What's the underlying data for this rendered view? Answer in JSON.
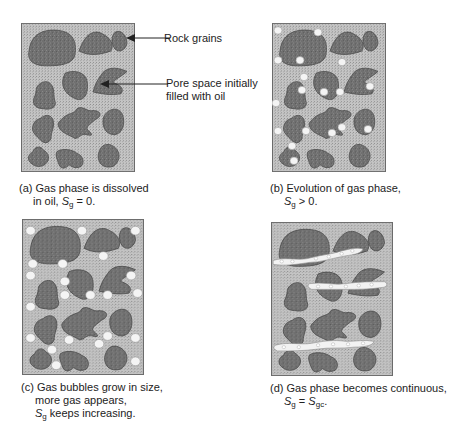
{
  "figure": {
    "colors": {
      "pore_oil": "#b9b9b9",
      "rock_grain": "#6f6f6f",
      "grain_outline": "#4a4a4a",
      "gas_bubble": "#f4f4f4",
      "frame": "#6b6b6b"
    },
    "labels": {
      "rock_grains": "Rock grains",
      "pore_space_line1": "Pore space initially",
      "pore_space_line2": "filled with oil"
    },
    "panels": [
      {
        "id": "a",
        "caption_line1": "(a) Gas phase is dissolved",
        "caption_line2_pre": "in oil,  ",
        "symbol": "S",
        "subscript": "g",
        "caption_line2_post": " = 0."
      },
      {
        "id": "b",
        "caption_line1": "(b) Evolution of gas phase,",
        "symbol": "S",
        "subscript": "g",
        "caption_line2_post": " > 0."
      },
      {
        "id": "c",
        "caption_line1": "(c) Gas bubbles grow in size,",
        "caption_line2": "more gas appears,",
        "symbol": "S",
        "subscript": "g",
        "caption_line3_post": " keeps increasing."
      },
      {
        "id": "d",
        "caption_line1": "(d) Gas phase becomes continuous,",
        "symbol": "S",
        "subscript": "g",
        "caption_line2_mid": " = ",
        "symbol2": "S",
        "subscript2": "gc",
        "caption_line2_post": "."
      }
    ]
  }
}
